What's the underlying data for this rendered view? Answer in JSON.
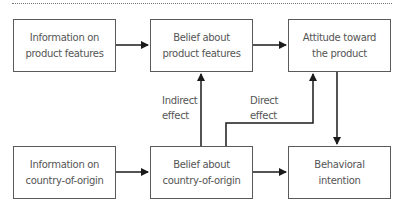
{
  "diagram": {
    "boxes": {
      "info_product": "Information on\nproduct features",
      "belief_product": "Belief about\nproduct features",
      "attitude": "Attitude toward\nthe product",
      "info_country": "Information on\ncountry-of-origin",
      "belief_country": "Belief about\ncountry-of-origin",
      "intention": "Behavioral\nintention"
    },
    "labels": {
      "indirect": "Indirect\neffect",
      "direct": "Direct\neffect"
    },
    "colors": {
      "border": "#5a5a5a",
      "arrow": "#1a1a1a",
      "text": "#555555"
    }
  }
}
